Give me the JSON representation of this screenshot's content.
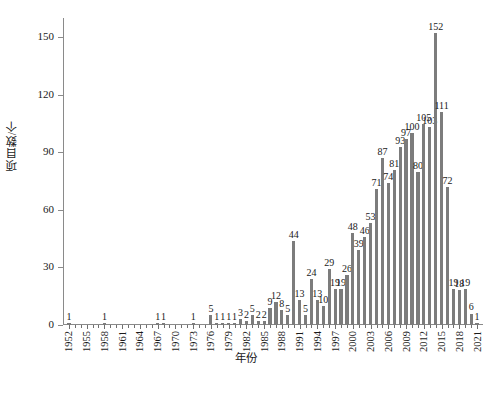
{
  "chart_data": {
    "type": "bar",
    "title": "",
    "xlabel": "年份",
    "ylabel": "项目数/个",
    "ylim": [
      0,
      160
    ],
    "yticks": [
      0,
      30,
      60,
      90,
      120,
      150
    ],
    "grid": false,
    "legend": false,
    "bar_color": "#7c7c7c",
    "axis_color": "#8a8a8a",
    "text_color": "#1a1a1a",
    "xtick_step": 3,
    "xtick_labels": [
      "1952",
      "1955",
      "1958",
      "1961",
      "1964",
      "1967",
      "1970",
      "1973",
      "1976",
      "1979",
      "1982",
      "1985",
      "1988",
      "1991",
      "1994",
      "1997",
      "2000",
      "2003",
      "2006",
      "2009",
      "2012",
      "2015",
      "2018",
      "2021"
    ],
    "categories": [
      "1952",
      "1953",
      "1954",
      "1955",
      "1956",
      "1957",
      "1958",
      "1959",
      "1960",
      "1961",
      "1962",
      "1963",
      "1964",
      "1965",
      "1966",
      "1967",
      "1968",
      "1969",
      "1970",
      "1971",
      "1972",
      "1973",
      "1974",
      "1975",
      "1976",
      "1977",
      "1978",
      "1979",
      "1980",
      "1981",
      "1982",
      "1983",
      "1984",
      "1985",
      "1986",
      "1987",
      "1988",
      "1989",
      "1990",
      "1991",
      "1992",
      "1993",
      "1994",
      "1995",
      "1996",
      "1997",
      "1998",
      "1999",
      "2000",
      "2001",
      "2002",
      "2003",
      "2004",
      "2005",
      "2006",
      "2007",
      "2008",
      "2009",
      "2010",
      "2011",
      "2012",
      "2013",
      "2014",
      "2015",
      "2016",
      "2017",
      "2018",
      "2019",
      "2020",
      "2021"
    ],
    "values": [
      1,
      0,
      0,
      0,
      0,
      0,
      1,
      0,
      0,
      0,
      0,
      0,
      0,
      0,
      0,
      1,
      1,
      0,
      0,
      0,
      0,
      1,
      0,
      0,
      5,
      1,
      1,
      1,
      1,
      3,
      2,
      5,
      2,
      2,
      9,
      12,
      8,
      5,
      44,
      13,
      5,
      24,
      13,
      10,
      29,
      19,
      19,
      26,
      48,
      39,
      46,
      53,
      71,
      87,
      74,
      81,
      93,
      97,
      100,
      80,
      105,
      103,
      152,
      111,
      72,
      19,
      18,
      19,
      6,
      1
    ],
    "labeled_values": [
      {
        "year": "1952",
        "value": 1
      },
      {
        "year": "1958",
        "value": 1
      },
      {
        "year": "1967",
        "value": 1
      },
      {
        "year": "1968",
        "value": 1
      },
      {
        "year": "1973",
        "value": 1
      },
      {
        "year": "1976",
        "value": 5
      },
      {
        "year": "1977",
        "value": 1
      },
      {
        "year": "1978",
        "value": 1
      },
      {
        "year": "1979",
        "value": 1
      },
      {
        "year": "1980",
        "value": 1
      },
      {
        "year": "1981",
        "value": 3
      },
      {
        "year": "1982",
        "value": 2
      },
      {
        "year": "1983",
        "value": 5
      },
      {
        "year": "1984",
        "value": 2
      },
      {
        "year": "1985",
        "value": 2
      },
      {
        "year": "1986",
        "value": 9
      },
      {
        "year": "1987",
        "value": 12
      },
      {
        "year": "1988",
        "value": 8
      },
      {
        "year": "1989",
        "value": 5
      },
      {
        "year": "1990",
        "value": 44
      },
      {
        "year": "1991",
        "value": 13
      },
      {
        "year": "1992",
        "value": 5
      },
      {
        "year": "1993",
        "value": 24
      },
      {
        "year": "1994",
        "value": 13
      },
      {
        "year": "1995",
        "value": 10
      },
      {
        "year": "1996",
        "value": 29
      },
      {
        "year": "1997",
        "value": 19
      },
      {
        "year": "1998",
        "value": 19
      },
      {
        "year": "1999",
        "value": 26
      },
      {
        "year": "2000",
        "value": 48
      },
      {
        "year": "2001",
        "value": 39
      },
      {
        "year": "2002",
        "value": 46
      },
      {
        "year": "2003",
        "value": 53
      },
      {
        "year": "2004",
        "value": 71
      },
      {
        "year": "2005",
        "value": 87
      },
      {
        "year": "2006",
        "value": 74
      },
      {
        "year": "2007",
        "value": 81
      },
      {
        "year": "2008",
        "value": 93
      },
      {
        "year": "2009",
        "value": 97
      },
      {
        "year": "2010",
        "value": 100
      },
      {
        "year": "2011",
        "value": 80
      },
      {
        "year": "2012",
        "value": 105
      },
      {
        "year": "2013",
        "value": 103
      },
      {
        "year": "2014",
        "value": 152
      },
      {
        "year": "2015",
        "value": 111
      },
      {
        "year": "2016",
        "value": 72
      },
      {
        "year": "2017",
        "value": 19
      },
      {
        "year": "2018",
        "value": 18
      },
      {
        "year": "2019",
        "value": 19
      },
      {
        "year": "2020",
        "value": 6
      },
      {
        "year": "2021",
        "value": 1
      }
    ]
  }
}
